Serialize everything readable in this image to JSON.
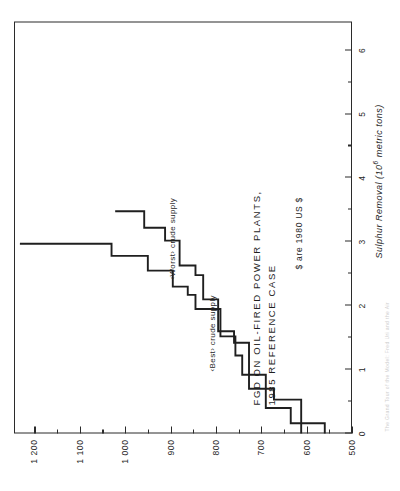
{
  "figure": {
    "title_line1": "FGD ON OIL-FIRED POWER PLANTS,",
    "title_line2": "1985 REFERENCE CASE",
    "currency_note": "$ are 1980 US $",
    "edge_caption": "The Grand Tour of the Model: Fred Uri and the Air"
  },
  "annotations": {
    "best": "‹Best› crude supply",
    "worst": "‹Worst› crude supply"
  },
  "axes": {
    "x": {
      "label_text": "Sulphur Removal (10",
      "label_exp": "6",
      "label_tail": " metric tons)",
      "ticks": [
        "0",
        "1",
        "2",
        "3",
        "4",
        "5",
        "6"
      ],
      "min": 0,
      "max": 6.45
    },
    "y": {
      "ticks": [
        "500",
        "600",
        "700",
        "800",
        "900",
        "1 000",
        "1 100",
        "1 200"
      ],
      "min": 500,
      "max": 1245
    }
  },
  "chart_data": {
    "type": "line",
    "title": "FGD ON OIL-FIRED POWER PLANTS, 1985 REFERENCE CASE",
    "xlabel": "Sulphur Removal (10^6 metric tons)",
    "ylabel": "Cost ($ per metric ton, 1980 US $)",
    "xlim": [
      0,
      6.45
    ],
    "ylim": [
      500,
      1245
    ],
    "grid": false,
    "legend": "in-plot annotations",
    "note": "$ are 1980 US $",
    "series": [
      {
        "name": "‹Best› crude supply",
        "style": "step-post",
        "points": [
          {
            "x": 0.0,
            "y": 560
          },
          {
            "x": 0.16,
            "y": 560
          },
          {
            "x": 0.16,
            "y": 635
          },
          {
            "x": 0.4,
            "y": 635
          },
          {
            "x": 0.4,
            "y": 690
          },
          {
            "x": 0.92,
            "y": 690
          },
          {
            "x": 0.92,
            "y": 742
          },
          {
            "x": 1.22,
            "y": 742
          },
          {
            "x": 1.22,
            "y": 757
          },
          {
            "x": 1.52,
            "y": 757
          },
          {
            "x": 1.52,
            "y": 790
          },
          {
            "x": 1.95,
            "y": 790
          },
          {
            "x": 1.95,
            "y": 845
          },
          {
            "x": 2.17,
            "y": 845
          },
          {
            "x": 2.17,
            "y": 862
          },
          {
            "x": 2.3,
            "y": 862
          },
          {
            "x": 2.3,
            "y": 895
          },
          {
            "x": 2.55,
            "y": 895
          },
          {
            "x": 2.55,
            "y": 950
          },
          {
            "x": 2.78,
            "y": 950
          },
          {
            "x": 2.78,
            "y": 1030
          },
          {
            "x": 2.97,
            "y": 1030
          },
          {
            "x": 2.97,
            "y": 1232
          }
        ]
      },
      {
        "name": "‹Worst› crude supply",
        "style": "step-post",
        "points": [
          {
            "x": 0.0,
            "y": 612
          },
          {
            "x": 0.53,
            "y": 612
          },
          {
            "x": 0.53,
            "y": 672
          },
          {
            "x": 0.7,
            "y": 672
          },
          {
            "x": 0.7,
            "y": 727
          },
          {
            "x": 1.42,
            "y": 727
          },
          {
            "x": 1.42,
            "y": 760
          },
          {
            "x": 1.6,
            "y": 760
          },
          {
            "x": 1.6,
            "y": 795
          },
          {
            "x": 2.1,
            "y": 795
          },
          {
            "x": 2.1,
            "y": 828
          },
          {
            "x": 2.48,
            "y": 828
          },
          {
            "x": 2.48,
            "y": 845
          },
          {
            "x": 2.63,
            "y": 845
          },
          {
            "x": 2.63,
            "y": 880
          },
          {
            "x": 3.02,
            "y": 880
          },
          {
            "x": 3.02,
            "y": 912
          },
          {
            "x": 3.22,
            "y": 912
          },
          {
            "x": 3.22,
            "y": 958
          },
          {
            "x": 3.48,
            "y": 958
          },
          {
            "x": 3.48,
            "y": 1022
          }
        ]
      }
    ]
  }
}
